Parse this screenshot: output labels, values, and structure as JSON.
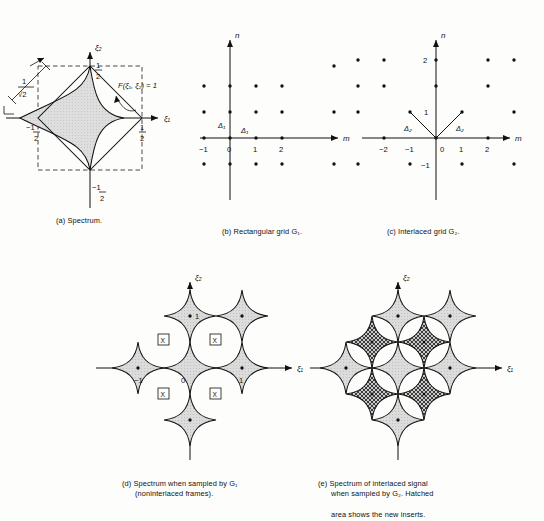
{
  "figure": {
    "background": "#fdfdfb",
    "ink": "#111111",
    "shade_fill": "#d9d9d9",
    "hatch_fill": "#4a4a4a"
  },
  "panels": {
    "a": {
      "caption": "(a) Spectrum.",
      "axis_x_label": "ξ₁",
      "axis_y_label": "ξ₂",
      "tick_labels": {
        "x_pos": "1⁄2",
        "x_neg": "−1⁄2",
        "y_pos": "1⁄2",
        "y_neg": "−1⁄2"
      },
      "annotation_region": "F(ξ₁, ξ₂) = 1",
      "annotation_dimension": "1⁄√2",
      "dimension_numerator": "1",
      "dimension_denominator": "√2",
      "shapes": {
        "dashed_square_half_width": 0.5,
        "diamond_vertices": [
          [
            0.5,
            0
          ],
          [
            0,
            0.5
          ],
          [
            -0.5,
            0
          ],
          [
            0,
            -0.5
          ]
        ],
        "inner_astroid_radius": 0.5,
        "inner_astroid_shaded": true
      }
    },
    "b": {
      "caption": "(b) Rectangular grid G₁.",
      "axis_x_label": "m",
      "axis_y_label": "n",
      "x_ticks": [
        "−1",
        "0",
        "1",
        "2"
      ],
      "x_tick_values": [
        -1,
        0,
        1,
        2
      ],
      "spacing_label_x": "Δ₁",
      "spacing_label_y": "Δ₁",
      "lattice_type": "rectangular",
      "lattice_points_m": [
        -1,
        0,
        1,
        2
      ],
      "lattice_points_n": [
        -1,
        0,
        1,
        2
      ]
    },
    "c": {
      "caption": "(c) Interlaced grid G₂.",
      "axis_x_label": "m",
      "axis_y_label": "n",
      "x_ticks": [
        "−2",
        "−1",
        "0",
        "1",
        "2"
      ],
      "x_tick_values": [
        -2,
        -1,
        0,
        1,
        2
      ],
      "y_ticks": [
        "−1",
        "1",
        "2"
      ],
      "y_tick_values": [
        -1,
        1,
        2
      ],
      "spacing_label_left": "Δ₂",
      "spacing_label_right": "Δ₂",
      "lattice_type": "quincunx",
      "lattice_rule": "m + n even",
      "basis_vectors": [
        [
          1,
          1
        ],
        [
          -1,
          1
        ]
      ]
    },
    "d": {
      "caption_line1": "(d) Spectrum when sampled by G₁",
      "caption_line2": "(noninterlaced frames).",
      "axis_x_label": "ξ₁",
      "axis_y_label": "ξ₂",
      "x_ticks": [
        "−1",
        "0",
        "1"
      ],
      "x_tick_values": [
        -1,
        0,
        1
      ],
      "y_ticks": [
        "1"
      ],
      "y_tick_values": [
        1
      ],
      "replica_centers": [
        [
          -1,
          0
        ],
        [
          0,
          0
        ],
        [
          1,
          0
        ],
        [
          0,
          1
        ],
        [
          0,
          -1
        ],
        [
          1,
          1
        ]
      ],
      "gap_marker": "X",
      "gap_marker_positions": [
        [
          -0.5,
          0.5
        ],
        [
          0.5,
          0.5
        ],
        [
          -0.5,
          -0.5
        ],
        [
          0.5,
          -0.5
        ]
      ],
      "astroid_radius": 0.5
    },
    "e": {
      "caption_line1": "(e) Spectrum of interlaced signal",
      "caption_line2": "when sampled by G₂. Hatched",
      "caption_line3": "area shows the new inserts.",
      "axis_x_label": "ξ₁",
      "axis_y_label": "ξ₂",
      "replica_centers": [
        [
          -1,
          0
        ],
        [
          0,
          0
        ],
        [
          1,
          0
        ],
        [
          0,
          1
        ],
        [
          0,
          -1
        ],
        [
          1,
          1
        ]
      ],
      "insert_centers": [
        [
          -0.5,
          0.5
        ],
        [
          0.5,
          0.5
        ],
        [
          -0.5,
          -0.5
        ],
        [
          0.5,
          -0.5
        ]
      ],
      "insert_style": "cross-hatched",
      "astroid_radius": 0.5
    }
  }
}
